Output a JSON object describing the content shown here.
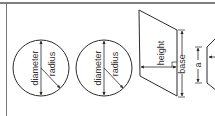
{
  "diagram": {
    "colors": {
      "stroke": "#2a2a2a",
      "text": "#333333",
      "frame": "#555555",
      "background": "#ffffff"
    },
    "circles": [
      {
        "id": "circle-1",
        "diameter_label": "diameter",
        "radius_label": "radius"
      },
      {
        "id": "circle-2",
        "diameter_label": "diameter",
        "radius_label": "radius"
      }
    ],
    "parallelogram": {
      "height_label": "height",
      "base_label": "base"
    },
    "polygon": {
      "side_label": "a"
    }
  }
}
